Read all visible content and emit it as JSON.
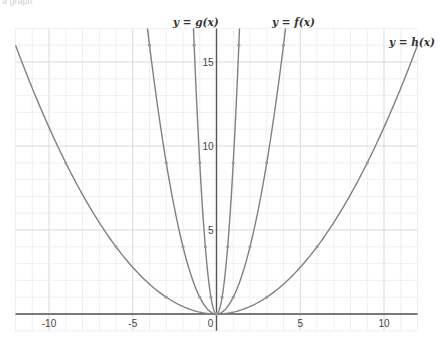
{
  "caption": "a graph",
  "chart_data": {
    "type": "line",
    "title": "",
    "xlabel": "",
    "ylabel": "",
    "xlim": [
      -12,
      12
    ],
    "ylim": [
      -1,
      17
    ],
    "grid": true,
    "grid_minor_step": 1,
    "grid_major_step": 5,
    "x_ticks": [
      -10,
      -5,
      0,
      5,
      10
    ],
    "x_tick_labels": [
      "-10",
      "-5",
      "0",
      "5",
      "10"
    ],
    "y_ticks": [
      5,
      10,
      15
    ],
    "y_tick_labels": [
      "5",
      "10",
      "15"
    ],
    "color": "#808080",
    "series": [
      {
        "name": "g",
        "label": "y = g(x)",
        "formula": "9x^2",
        "coef": 9,
        "marked_points": [
          [
            -1.3333,
            16
          ],
          [
            -1,
            9
          ],
          [
            -0.6667,
            4
          ],
          [
            -0.3333,
            1
          ],
          [
            0,
            0
          ],
          [
            0.3333,
            1
          ],
          [
            0.6667,
            4
          ],
          [
            1,
            9
          ],
          [
            1.3333,
            16
          ]
        ]
      },
      {
        "name": "f",
        "label": "y = f(x)",
        "formula": "x^2",
        "coef": 1,
        "marked_points": [
          [
            -4,
            16
          ],
          [
            -3,
            9
          ],
          [
            -2,
            4
          ],
          [
            -1,
            1
          ],
          [
            0,
            0
          ],
          [
            1,
            1
          ],
          [
            2,
            4
          ],
          [
            3,
            9
          ],
          [
            4,
            16
          ]
        ]
      },
      {
        "name": "h",
        "label": "y = h(x)",
        "formula": "x^2/9",
        "coef": 0.1111,
        "marked_points": [
          [
            -9,
            9
          ],
          [
            -6,
            4
          ],
          [
            -3,
            1
          ],
          [
            0,
            0
          ],
          [
            3,
            1
          ],
          [
            6,
            4
          ],
          [
            9,
            9
          ]
        ]
      }
    ]
  }
}
